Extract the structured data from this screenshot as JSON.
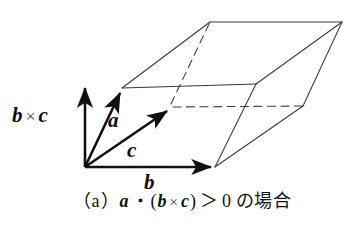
{
  "figure": {
    "kind": "vector-triple-product-parallelepiped",
    "background_color": "#ffffff",
    "stroke_color": "#1a1a1a",
    "thin_stroke_color": "#444444",
    "axis_labels": {
      "bxc": {
        "left_vec": "b",
        "operator": "×",
        "right_vec": "c"
      },
      "a": "a",
      "c": "c",
      "b": "b"
    },
    "caption": {
      "open_paren": "（",
      "tag": "a",
      "close_paren": "）",
      "vec_a": "a",
      "dot": "・",
      "group_open": "(",
      "vec_b": "b",
      "cross": "×",
      "vec_c": "c",
      "group_close": ")",
      "relation": "＞",
      "value": "0",
      "japanese": "の場合",
      "full_text": "（a）a・(b×c)＞0 の場合"
    },
    "geometry": {
      "origin": [
        85,
        167
      ],
      "b_tip": [
        215,
        167
      ],
      "c_tip": [
        171,
        107
      ],
      "a_tip": [
        122,
        88
      ],
      "top_front_left": [
        122,
        88
      ],
      "top_front_right": [
        256,
        84
      ],
      "top_back_right": [
        342,
        22
      ],
      "top_back_left": [
        210,
        22
      ],
      "base_front_left": [
        85,
        167
      ],
      "base_front_right": [
        215,
        167
      ],
      "base_back_right": [
        303,
        106
      ],
      "base_back_left": [
        171,
        107
      ],
      "hidden_edges": [
        "base_back_left-base_back_right",
        "top_back_left-base_back_left"
      ]
    }
  }
}
